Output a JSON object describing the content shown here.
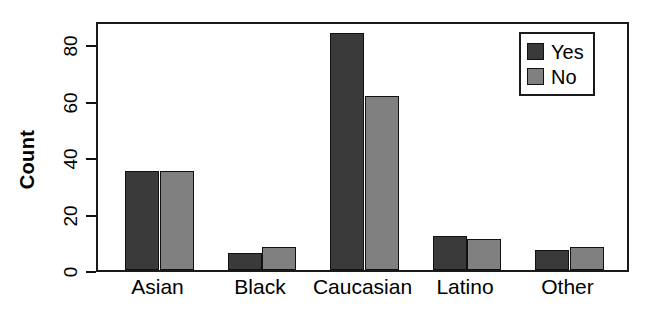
{
  "chart_data": {
    "type": "bar",
    "title": "",
    "subtitle": "",
    "xlabel": "",
    "ylabel": "Count",
    "categories": [
      "Asian",
      "Black",
      "Caucasian",
      "Latino",
      "Other"
    ],
    "series": [
      {
        "name": "Yes",
        "color": "#3a3a3a",
        "values": [
          35,
          6,
          84,
          12,
          7
        ]
      },
      {
        "name": "No",
        "color": "#808080",
        "values": [
          35,
          8,
          61.5,
          11,
          8
        ]
      }
    ],
    "legend": {
      "position": "top-right",
      "entries": [
        {
          "label": "Yes",
          "color": "#3a3a3a"
        },
        {
          "label": "No",
          "color": "#808080"
        }
      ]
    },
    "yaxis": {
      "label": "Count",
      "ticks": [
        0,
        20,
        40,
        60,
        80
      ],
      "tick_labels": [
        "0",
        "20",
        "40",
        "60",
        "80"
      ],
      "ylim": [
        0,
        88.5
      ],
      "rotated_labels": true
    },
    "xaxis": {
      "tick_labels": [
        "Asian",
        "Black",
        "Caucasian",
        "Latino",
        "Other"
      ]
    },
    "grid": false,
    "frame": true
  }
}
